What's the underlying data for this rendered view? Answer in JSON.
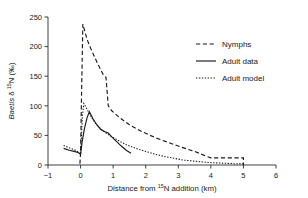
{
  "figure": {
    "background": "#ffffff",
    "ink_color": "#1a1a1a"
  },
  "chart_data": {
    "type": "line",
    "title": "",
    "xlabel": "Distance from 15N addition (km)",
    "xlabel_parts": {
      "pre": "Distance from ",
      "sup": "15",
      "post": "N addition (km)"
    },
    "ylabel": "Baetis δ 15N (‰)",
    "ylabel_parts": {
      "italic": "Baetis",
      "delta": " δ ",
      "sup": "15",
      "post": "N (‰)"
    },
    "xlim": [
      -1,
      6
    ],
    "ylim": [
      0,
      250
    ],
    "xticks": [
      -1,
      0,
      1,
      2,
      3,
      4,
      5,
      6
    ],
    "xticklabels": [
      "−1",
      "0",
      "1",
      "2",
      "3",
      "4",
      "5",
      "6"
    ],
    "yticks": [
      0,
      50,
      100,
      150,
      200,
      250
    ],
    "yticklabels": [
      "0",
      "50",
      "100",
      "150",
      "200",
      "250"
    ],
    "grid": false,
    "legend_position": "upper right",
    "series": [
      {
        "name": "Nymphs",
        "style": "dashed",
        "x": [
          -0.02,
          0.0,
          0.03,
          0.07,
          0.12,
          0.2,
          0.32,
          0.45,
          0.58,
          0.7,
          0.78,
          0.85,
          0.95,
          1.2,
          1.5,
          1.9,
          2.3,
          2.7,
          3.1,
          3.5,
          3.9,
          4.0,
          4.5,
          5.0,
          5.0
        ],
        "y": [
          2,
          20,
          120,
          238,
          228,
          212,
          196,
          180,
          165,
          152,
          148,
          100,
          92,
          80,
          68,
          56,
          46,
          38,
          30,
          23,
          14,
          12,
          12,
          12,
          0
        ]
      },
      {
        "name": "Adult data",
        "style": "solid",
        "x": [
          -0.52,
          -0.35,
          -0.2,
          -0.08,
          -0.02,
          0.0,
          0.05,
          0.12,
          0.2,
          0.27,
          0.38,
          0.5,
          0.62,
          0.75,
          0.85,
          0.95,
          1.1,
          1.25,
          1.4,
          1.55
        ],
        "y": [
          28,
          25,
          23,
          21,
          19,
          18,
          40,
          62,
          80,
          90,
          78,
          68,
          60,
          56,
          54,
          48,
          40,
          32,
          25,
          20
        ]
      },
      {
        "name": "Adult model",
        "style": "dotted",
        "x": [
          -0.52,
          -0.35,
          -0.2,
          -0.1,
          -0.03,
          0.0,
          0.03,
          0.06,
          0.1,
          0.16,
          0.24,
          0.34,
          0.46,
          0.6,
          0.78,
          0.95,
          1.2,
          1.45,
          1.7,
          2.0,
          2.3,
          2.6,
          2.9,
          3.2,
          3.6,
          4.0,
          4.4,
          4.8,
          5.0
        ],
        "y": [
          33,
          29,
          26,
          23,
          20,
          18,
          52,
          85,
          104,
          98,
          90,
          80,
          70,
          62,
          54,
          48,
          40,
          33,
          28,
          23,
          18,
          14,
          11,
          8,
          6,
          4,
          3,
          2,
          2
        ]
      }
    ]
  },
  "legend": {
    "entries": [
      {
        "label": "Nymphs",
        "style": "dashed"
      },
      {
        "label": "Adult data",
        "style": "solid"
      },
      {
        "label": "Adult model",
        "style": "dotted"
      }
    ]
  }
}
